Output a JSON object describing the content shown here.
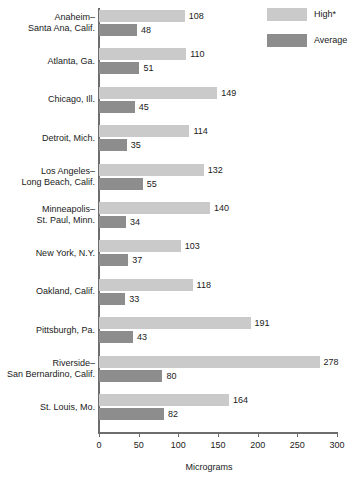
{
  "chart_data": {
    "type": "bar",
    "orientation": "horizontal",
    "title": "",
    "xlabel": "Micrograms",
    "ylabel": "",
    "xlim": [
      0,
      300
    ],
    "xticks": [
      0,
      50,
      100,
      150,
      200,
      250,
      300
    ],
    "grid": false,
    "legend_position": "top-right",
    "categories": [
      "Anaheim–\nSanta Ana, Calif.",
      "Atlanta, Ga.",
      "Chicago, Ill.",
      "Detroit, Mich.",
      "Los Angeles–\nLong Beach, Calif.",
      "Minneapolis–\nSt. Paul, Minn.",
      "New York, N.Y.",
      "Oakland, Calif.",
      "Pittsburgh, Pa.",
      "Riverside–\nSan Bernardino, Calif.",
      "St. Louis, Mo."
    ],
    "series": [
      {
        "name": "High*",
        "color": "#cacaca",
        "values": [
          108,
          110,
          149,
          114,
          132,
          140,
          103,
          118,
          191,
          278,
          164
        ]
      },
      {
        "name": "Average",
        "color": "#8d8d8d",
        "values": [
          48,
          51,
          45,
          35,
          55,
          34,
          37,
          33,
          43,
          80,
          82
        ]
      }
    ]
  },
  "legend": {
    "items": [
      {
        "label": "High*",
        "color": "#cacaca"
      },
      {
        "label": "Average",
        "color": "#8d8d8d"
      }
    ]
  },
  "axis": {
    "title": "Micrograms",
    "tick_labels": [
      "0",
      "50",
      "100",
      "150",
      "200",
      "250",
      "300"
    ]
  }
}
